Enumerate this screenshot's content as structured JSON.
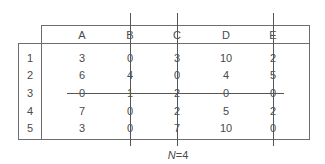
{
  "table": {
    "columns": [
      "A",
      "B",
      "C",
      "D",
      "E"
    ],
    "rows": [
      {
        "label": "1",
        "values": [
          "3",
          "0",
          "3",
          "10",
          "2"
        ]
      },
      {
        "label": "2",
        "values": [
          "6",
          "4",
          "0",
          "4",
          "5"
        ]
      },
      {
        "label": "3",
        "values": [
          "0",
          "1",
          "2",
          "0",
          "0"
        ]
      },
      {
        "label": "4",
        "values": [
          "7",
          "0",
          "2",
          "5",
          "2"
        ]
      },
      {
        "label": "5",
        "values": [
          "3",
          "0",
          "7",
          "10",
          "0"
        ]
      }
    ],
    "struck_row": "3",
    "marked_columns": [
      "B",
      "C",
      "E"
    ]
  },
  "caption": {
    "variable": "N",
    "equals": "=",
    "value": "4"
  },
  "colors": {
    "line": "#6d6d6d",
    "mark": "#555555",
    "text": "#4a4a4a"
  }
}
